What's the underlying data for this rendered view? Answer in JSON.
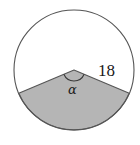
{
  "figure": {
    "background_color": "#ffffff",
    "stroke_color": "#555555",
    "sector_fill_color": "#b5b5b5",
    "labels": {
      "radius": "18",
      "angle": "α"
    },
    "icons": {
      "circle": "circle-outline-icon",
      "sector": "shaded-sector-icon",
      "angle_arc": "angle-arc-icon"
    },
    "geometry": {
      "center_x": 74,
      "center_y": 70,
      "radius": 60,
      "sector_start_angle_deg": 203,
      "sector_end_angle_deg": 337,
      "sector_sweep_deg": 134,
      "angle_arc_radius": 11
    }
  }
}
